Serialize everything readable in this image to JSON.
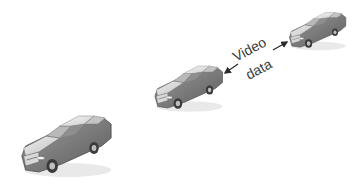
{
  "diagram": {
    "label_line1": "Video",
    "label_line2": "data",
    "elements": [
      {
        "id": "car-front",
        "kind": "car",
        "size": "large"
      },
      {
        "id": "car-middle",
        "kind": "car",
        "size": "medium"
      },
      {
        "id": "car-back",
        "kind": "car",
        "size": "small"
      }
    ],
    "arrows": [
      {
        "from": "label",
        "to": "car-middle"
      },
      {
        "from": "label",
        "to": "car-back"
      }
    ],
    "colors": {
      "car_body": "#7a7a7a",
      "car_roof": "#e6e6e6",
      "car_glass": "#bdbdbd",
      "wheel": "#3a3a3a",
      "text": "#3a3a3a",
      "arrow": "#2a2a2a"
    }
  }
}
